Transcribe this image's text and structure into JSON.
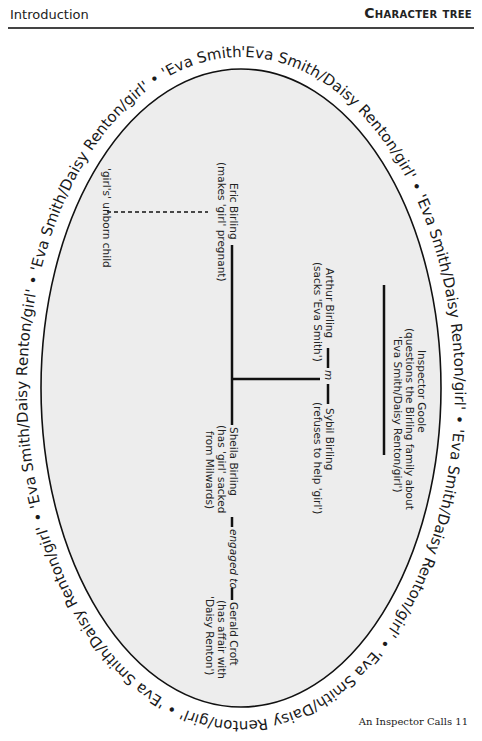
{
  "header": {
    "left": "Introduction",
    "right": "Character tree"
  },
  "diagram": {
    "ring_text": "'Eva Smith/Daisy Renton/girl' • 'Eva Smith/Daisy Renton/girl' • 'Eva Smith/Daisy Renton/girl' • 'Eva Smith/Daisy Renton/girl' • 'Eva Smith/Daisy Renton/girl' • 'Eva Smith/Daisy Renton/girl' • 'Eva Smith/Daisy Renton/girl' • 'Eva Smith/Daisy Renton/girl' • ",
    "ring_unit": "'Eva Smith/Daisy Renton/girl'",
    "ellipse_fill": "#ededed",
    "line_color": "#111111",
    "nodes": {
      "inspector": {
        "name": "Inspector Goole",
        "desc1": "(questions the Birling family about",
        "desc2": "'Eva Smith/Daisy Renton/girl')"
      },
      "arthur": {
        "name": "Arthur Birling",
        "desc": "(sacks 'Eva Smith')"
      },
      "marriage": "m",
      "sybil": {
        "name": "Sybil Birling",
        "desc": "(refuses to help 'girl')"
      },
      "eric": {
        "name": "Eric Birling",
        "desc": "(makes 'girl' pregnant)"
      },
      "child": {
        "name": "'girl's' unborn child"
      },
      "sheila": {
        "name": "Sheila Birling",
        "desc1": "(has 'girl' sacked",
        "desc2": "from Milwards)"
      },
      "engaged": "engaged to",
      "gerald": {
        "name": "Gerald Croft",
        "desc1": "(has affair with",
        "desc2": "'Daisy Renton')"
      }
    }
  },
  "footer": {
    "text": "An Inspector Calls 11"
  }
}
